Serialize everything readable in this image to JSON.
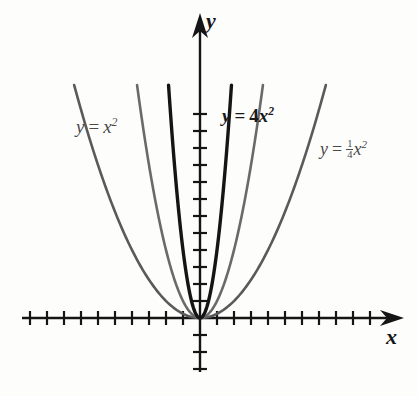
{
  "figure": {
    "kind": "coordinate-plane-parabolas",
    "width": 418,
    "height": 396,
    "background": "#fdfdfc"
  },
  "axes": {
    "x_axis": {
      "name": "x",
      "color": "#151515",
      "y_pixel": 318,
      "x_start": 22,
      "x_end": 402,
      "arrow": "right",
      "tick_spacing": 17,
      "tick_half_length": 7,
      "tick_count_left": 10,
      "tick_count_right": 10
    },
    "y_axis": {
      "name": "y",
      "color": "#151515",
      "x_pixel": 200,
      "y_start": 14,
      "y_end": 372,
      "arrow": "up",
      "tick_spacing": 17,
      "tick_half_length": 7,
      "tick_count_above": 13,
      "tick_count_below": 3
    },
    "origin": {
      "x": 200,
      "y": 318
    }
  },
  "chart_data": {
    "type": "line",
    "title": "",
    "xlabel": "x",
    "ylabel": "y",
    "grid": false,
    "legend": "inline-annotations",
    "xlim": [
      -10.5,
      10.5
    ],
    "ylim": [
      -3.5,
      13.5
    ],
    "series": [
      {
        "name": "y = 1/4 x^2",
        "coefficient": 0.25,
        "color": "#5a5a5a",
        "stroke_width": 2.6,
        "label": "y = 1/4 x^2",
        "vertex": [
          0,
          0
        ],
        "x": [
          -7.3,
          -6,
          -4.5,
          -3,
          -1.5,
          0,
          1.5,
          3,
          4.5,
          6,
          7.3
        ],
        "y": [
          13.3,
          9,
          5.06,
          2.25,
          0.56,
          0,
          0.56,
          2.25,
          5.06,
          9,
          13.3
        ]
      },
      {
        "name": "y = x^2",
        "coefficient": 1,
        "color": "#6a6a6a",
        "stroke_width": 2.6,
        "label": "y = x^2",
        "vertex": [
          0,
          0
        ],
        "x": [
          -3.7,
          -3,
          -2.25,
          -1.5,
          -0.75,
          0,
          0.75,
          1.5,
          2.25,
          3,
          3.7
        ],
        "y": [
          13.7,
          9,
          5.06,
          2.25,
          0.56,
          0,
          0.56,
          2.25,
          5.06,
          9,
          13.7
        ]
      },
      {
        "name": "y = 4x^2",
        "coefficient": 4,
        "color": "#151515",
        "stroke_width": 3.4,
        "label": "y = 4x^2",
        "vertex": [
          0,
          0
        ],
        "x": [
          -1.85,
          -1.5,
          -1.12,
          -0.75,
          -0.37,
          0,
          0.37,
          0.75,
          1.12,
          1.5,
          1.85
        ],
        "y": [
          13.7,
          9,
          5.06,
          2.25,
          0.56,
          0,
          0.56,
          2.25,
          5.06,
          9,
          13.7
        ]
      }
    ],
    "annotations": [
      {
        "id": "label-x2",
        "text": "y = x^2",
        "x_pixel": 76,
        "y_pixel": 117,
        "bold": false
      },
      {
        "id": "label-4x2",
        "text": "y = 4x^2",
        "x_pixel": 222,
        "y_pixel": 106,
        "bold": true
      },
      {
        "id": "label-quarter",
        "text": "y = 1/4 x^2",
        "x_pixel": 320,
        "y_pixel": 139,
        "bold": false
      }
    ]
  },
  "labels": {
    "axis_y": "y",
    "axis_x": "x",
    "eq_x2": {
      "lhs": "y",
      "eq": "=",
      "base": "x",
      "exponent": "2"
    },
    "eq_4x2": {
      "lhs": "y",
      "eq": "=",
      "coef": "4",
      "base": "x",
      "exponent": "2"
    },
    "eq_quarter": {
      "lhs": "y",
      "eq": "=",
      "numerator": "1",
      "denominator": "4",
      "base": "x",
      "exponent": "2"
    }
  }
}
